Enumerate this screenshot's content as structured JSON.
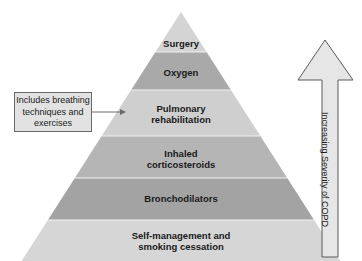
{
  "diagram": {
    "type": "pyramid",
    "layers": [
      {
        "label": "Surgery",
        "fill": "#d4d4d4"
      },
      {
        "label": "Oxygen",
        "fill": "#a9a9a9"
      },
      {
        "label": "Pulmonary rehabilitation",
        "line1": "Pulmonary",
        "line2": "rehabilitation",
        "fill": "#cfcfcf"
      },
      {
        "label": "Inhaled corticosteroids",
        "line1": "Inhaled",
        "line2": "corticosteroids",
        "fill": "#b5b5b5"
      },
      {
        "label": "Bronchodilators",
        "fill": "#a3a3a3"
      },
      {
        "label": "Self-management and smoking cessation",
        "line1": "Self-management and",
        "line2": "smoking cessation",
        "fill": "#d6d6d6"
      }
    ],
    "callout": {
      "line1": "Includes breathing",
      "line2": "techniques and",
      "line3": "exercises",
      "points_to": "Pulmonary rehabilitation"
    },
    "severity_arrow": {
      "label": "Increasing Severity of COPD",
      "direction": "up"
    }
  }
}
